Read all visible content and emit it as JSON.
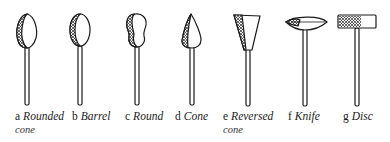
{
  "figure": {
    "type": "diagram",
    "items": [
      {
        "letter": "a",
        "name": "Rounded",
        "name_line2": "cone",
        "shape": "rounded-cone"
      },
      {
        "letter": "b",
        "name": "Barrel",
        "name_line2": "",
        "shape": "barrel"
      },
      {
        "letter": "c",
        "name": "Round",
        "name_line2": "",
        "shape": "round"
      },
      {
        "letter": "d",
        "name": "Cone",
        "name_line2": "",
        "shape": "cone"
      },
      {
        "letter": "e",
        "name": "Reversed",
        "name_line2": "cone",
        "shape": "reversed-cone"
      },
      {
        "letter": "f",
        "name": "Knife",
        "name_line2": "",
        "shape": "knife"
      },
      {
        "letter": "g",
        "name": "Disc",
        "name_line2": "",
        "shape": "disc"
      }
    ]
  },
  "colors": {
    "ink": "#1a1a1a",
    "background": "#ffffff"
  }
}
